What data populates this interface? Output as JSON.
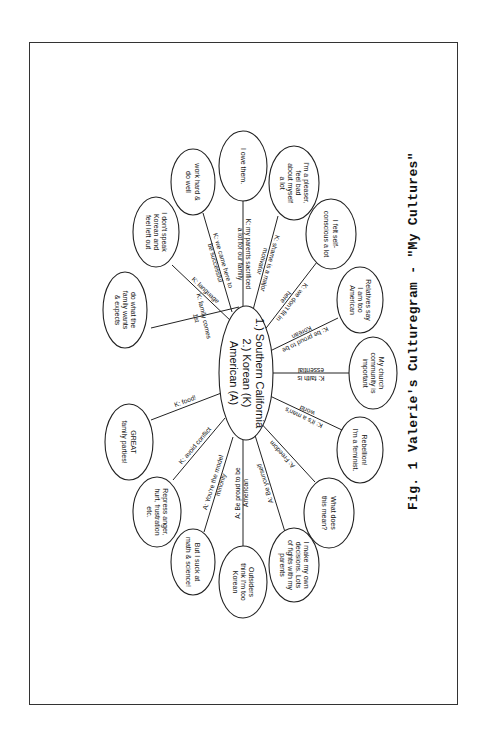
{
  "figure": {
    "label": "Fig. 1",
    "title": "Valerie's Culturegram - \"My Cultures\""
  },
  "center": {
    "lines": [
      "1.) Southern California",
      "2.) Korean (K)",
      "American (A)"
    ]
  },
  "nodes": [
    {
      "id": "family-expects",
      "lines": [
        "do what the",
        "family wants",
        "& expects"
      ],
      "link": [
        "K: family comes",
        "1st"
      ]
    },
    {
      "id": "dont-speak-korean",
      "lines": [
        "I don't speak",
        "Korean and",
        "feel left out"
      ],
      "link": [
        "K: language"
      ]
    },
    {
      "id": "work-hard",
      "lines": [
        "work hard &",
        "do well"
      ],
      "link": [
        "K: we came here to",
        "be successful"
      ]
    },
    {
      "id": "owe-them",
      "lines": [
        "I owe them."
      ],
      "link": [
        "K: my parents sacrificed",
        "a lot for our family"
      ]
    },
    {
      "id": "pleaser",
      "lines": [
        "I'm a pleaser,",
        "feel bad",
        "about myself",
        "a lot"
      ],
      "link": [
        "K: shame is a major",
        "motivator"
      ]
    },
    {
      "id": "self-conscious",
      "lines": [
        "I felt self-",
        "conscious a lot"
      ],
      "link": [
        "K: we don't fit in",
        "here"
      ]
    },
    {
      "id": "relatives-say",
      "lines": [
        "Relatives say",
        "I am too",
        "American"
      ],
      "link": [
        "K: be proud to be",
        "Korean"
      ]
    },
    {
      "id": "church-community",
      "lines": [
        "My church",
        "community is",
        "important"
      ],
      "link": [
        "K: faith is",
        "essential"
      ]
    },
    {
      "id": "rebellion",
      "lines": [
        "Rebellion!",
        "I'm a feminist."
      ],
      "link": [
        "K: it's a man's",
        "world"
      ]
    },
    {
      "id": "what-does-this-mean",
      "lines": [
        "What does",
        "this mean?"
      ],
      "link": [
        "A: Freedom"
      ]
    },
    {
      "id": "own-decisions",
      "lines": [
        "I make my own",
        "decisions. Lots",
        "of fights with my",
        "parents"
      ],
      "link": [
        "A: Be yourself"
      ]
    },
    {
      "id": "outsiders-think",
      "lines": [
        "Outsiders",
        "think I'm too",
        "Korean"
      ],
      "link": [
        "A:  Be proud to be",
        "American"
      ]
    },
    {
      "id": "suck-at-math",
      "lines": [
        "But I suck at",
        "math & science!"
      ],
      "link": [
        "A: You're the model",
        "minority"
      ]
    },
    {
      "id": "repress-anger",
      "lines": [
        "Repress anger,",
        "hurt, frustration",
        "etc."
      ],
      "link": [
        "K:  avoid conflict"
      ]
    },
    {
      "id": "family-parties",
      "lines": [
        "GREAT",
        "family parties!"
      ],
      "link": [
        "K: food!"
      ]
    }
  ],
  "colors": {
    "line": "#222222",
    "text": "#111111",
    "background": "#ffffff"
  }
}
